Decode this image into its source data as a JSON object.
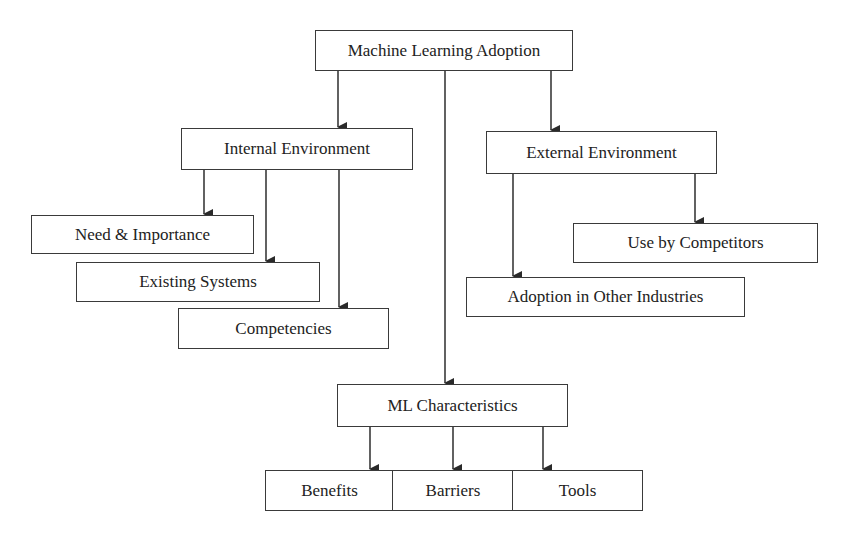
{
  "diagram": {
    "root": {
      "label": "Machine Learning Adoption"
    },
    "internal": {
      "label": "Internal Environment",
      "children": [
        {
          "label": "Need & Importance"
        },
        {
          "label": "Existing Systems"
        },
        {
          "label": "Competencies"
        }
      ]
    },
    "external": {
      "label": "External Environment",
      "children": [
        {
          "label": "Use by Competitors"
        },
        {
          "label": "Adoption in Other Industries"
        }
      ]
    },
    "ml": {
      "label": "ML Characteristics",
      "children": [
        {
          "label": "Benefits"
        },
        {
          "label": "Barriers"
        },
        {
          "label": "Tools"
        }
      ]
    },
    "colors": {
      "line": "#3a3a3a",
      "text": "#222222",
      "background": "#ffffff"
    }
  }
}
